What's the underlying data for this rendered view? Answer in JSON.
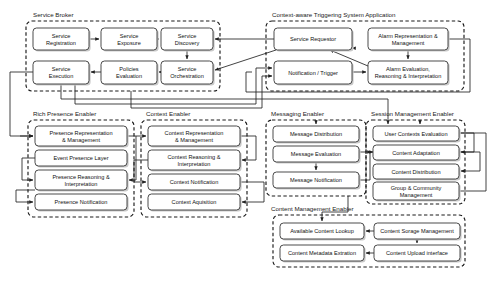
{
  "diagram": {
    "type": "block-diagram",
    "canvas": {
      "width": 503,
      "height": 283,
      "background": "#ffffff"
    },
    "style": {
      "group_border": "#1a1a1a",
      "group_border_style": "dashed",
      "box_border": "#2a2a2a",
      "box_fill": "#ffffff",
      "box_shadow": "#c9c9c9",
      "connector": "#222222"
    },
    "groups": [
      {
        "id": "service_broker",
        "label": "Service Broker",
        "label_x": 33,
        "label_y": 17,
        "x": 26,
        "y": 21,
        "w": 194,
        "h": 70,
        "boxes": [
          {
            "id": "sb_registration",
            "label": "Service\nRegistration",
            "x": 33,
            "y": 28,
            "w": 56,
            "h": 22
          },
          {
            "id": "sb_exposure",
            "label": "Service\nExposure",
            "x": 101,
            "y": 28,
            "w": 56,
            "h": 22
          },
          {
            "id": "sb_discovery",
            "label": "Service\nDiscovery",
            "x": 161,
            "y": 28,
            "w": 52,
            "h": 22
          },
          {
            "id": "sb_execution",
            "label": "Service\nExecution",
            "x": 33,
            "y": 61,
            "w": 56,
            "h": 23
          },
          {
            "id": "sb_policies",
            "label": "Policies\nEvaluation",
            "x": 101,
            "y": 61,
            "w": 56,
            "h": 23
          },
          {
            "id": "sb_orchestration",
            "label": "Service\nOrchestration",
            "x": 161,
            "y": 61,
            "w": 52,
            "h": 23
          }
        ]
      },
      {
        "id": "triggering_app",
        "label": "Context-aware Triggering System Application",
        "label_x": 272,
        "label_y": 17,
        "x": 266,
        "y": 21,
        "w": 198,
        "h": 70,
        "boxes": [
          {
            "id": "ta_requestor",
            "label": "Service Requestor",
            "x": 274,
            "y": 28,
            "w": 78,
            "h": 22
          },
          {
            "id": "ta_alarm_repr",
            "label": "Alarm Representation &\nManagement",
            "x": 368,
            "y": 28,
            "w": 80,
            "h": 22
          },
          {
            "id": "ta_notification",
            "label": "Notification / Trigger",
            "x": 274,
            "y": 61,
            "w": 78,
            "h": 23
          },
          {
            "id": "ta_alarm_eval",
            "label": "Alarm Evaluation,\nReasoning & Interpretation",
            "x": 368,
            "y": 61,
            "w": 80,
            "h": 23
          }
        ]
      },
      {
        "id": "rich_presence",
        "label": "Rich Presence Enabler",
        "label_x": 33,
        "label_y": 116,
        "x": 28,
        "y": 120,
        "w": 106,
        "h": 97,
        "boxes": [
          {
            "id": "rp_repr",
            "label": "Presence Representation\n& Management",
            "x": 35,
            "y": 126,
            "w": 92,
            "h": 20
          },
          {
            "id": "rp_event_layer",
            "label": "Event Presence Layer",
            "x": 35,
            "y": 150,
            "w": 92,
            "h": 16
          },
          {
            "id": "rp_reasoning",
            "label": "Presence Reasoning &\nInterpretation",
            "x": 35,
            "y": 170,
            "w": 92,
            "h": 20
          },
          {
            "id": "rp_notification",
            "label": "Presence Notification",
            "x": 35,
            "y": 194,
            "w": 92,
            "h": 16
          }
        ]
      },
      {
        "id": "context_enabler",
        "label": "Context Enabler",
        "label_x": 146,
        "label_y": 116,
        "x": 141,
        "y": 120,
        "w": 106,
        "h": 97,
        "boxes": [
          {
            "id": "ce_repr",
            "label": "Context Representation\n& Management",
            "x": 148,
            "y": 126,
            "w": 92,
            "h": 20
          },
          {
            "id": "ce_reasoning",
            "label": "Context Reasoning &\nInterpretation",
            "x": 148,
            "y": 150,
            "w": 92,
            "h": 20
          },
          {
            "id": "ce_notification",
            "label": "Context Notification",
            "x": 148,
            "y": 174,
            "w": 92,
            "h": 16
          },
          {
            "id": "ce_acquisition",
            "label": "Context Aquisition",
            "x": 148,
            "y": 194,
            "w": 92,
            "h": 16
          }
        ]
      },
      {
        "id": "messaging_enabler",
        "label": "Messaging Enabler",
        "label_x": 271,
        "label_y": 116,
        "x": 266,
        "y": 120,
        "w": 100,
        "h": 76,
        "boxes": [
          {
            "id": "me_distribution",
            "label": "Message Distribution",
            "x": 273,
            "y": 126,
            "w": 86,
            "h": 16
          },
          {
            "id": "me_evaluation",
            "label": "Message Evaluation",
            "x": 273,
            "y": 146,
            "w": 86,
            "h": 16
          },
          {
            "id": "me_notification",
            "label": "Message Notification",
            "x": 273,
            "y": 172,
            "w": 86,
            "h": 16
          }
        ]
      },
      {
        "id": "session_mgmt",
        "label": "Session Management Enabler",
        "label_x": 371,
        "label_y": 116,
        "x": 366,
        "y": 120,
        "w": 99,
        "h": 84,
        "boxes": [
          {
            "id": "sm_user_contexts",
            "label": "User Contexts Evaluation",
            "x": 373,
            "y": 126,
            "w": 86,
            "h": 15
          },
          {
            "id": "sm_adaptation",
            "label": "Content Adaptation",
            "x": 373,
            "y": 145,
            "w": 86,
            "h": 15
          },
          {
            "id": "sm_distribution",
            "label": "Content Distribution",
            "x": 373,
            "y": 164,
            "w": 86,
            "h": 15
          },
          {
            "id": "sm_group",
            "label": "Group & Community\nManagement",
            "x": 373,
            "y": 182,
            "w": 86,
            "h": 18
          }
        ]
      },
      {
        "id": "content_mgmt",
        "label": "Content Management Enabler",
        "label_x": 271,
        "label_y": 211,
        "x": 273,
        "y": 215,
        "w": 192,
        "h": 52,
        "boxes": [
          {
            "id": "cm_lookup",
            "label": "Available Content Lookup",
            "x": 280,
            "y": 223,
            "w": 84,
            "h": 16
          },
          {
            "id": "cm_storage",
            "label": "Content Sorage Management",
            "x": 374,
            "y": 223,
            "w": 86,
            "h": 16
          },
          {
            "id": "cm_metadata",
            "label": "Content Metadata Extration",
            "x": 280,
            "y": 245,
            "w": 84,
            "h": 16
          },
          {
            "id": "cm_upload",
            "label": "Content Upload interface",
            "x": 374,
            "y": 245,
            "w": 86,
            "h": 16
          }
        ]
      }
    ],
    "connectors": [
      {
        "id": "c-reg-exp",
        "d": "M 89,39 L 99,39",
        "arrow": "end"
      },
      {
        "id": "c-exp-disc",
        "d": "M 157,39 L 159,39",
        "arrow": "end"
      },
      {
        "id": "c-disc-orch",
        "d": "M 187,50 L 187,59",
        "arrow": "end"
      },
      {
        "id": "c-orch-pol",
        "d": "M 161,72 L 159,72",
        "arrow": "end"
      },
      {
        "id": "c-pol-exec",
        "d": "M 101,72 L 91,72",
        "arrow": "end"
      },
      {
        "id": "c-disc-in-right",
        "d": "M 272,39 L 215,39",
        "arrow": "end"
      },
      {
        "id": "c-req-out",
        "d": "M 274,39 L 272,39",
        "arrow": "none"
      },
      {
        "id": "c-req-to-orch",
        "d": "M 276,50 L 215,70",
        "arrow": "end"
      },
      {
        "id": "c-req-diag",
        "d": "M 352,48 L 310,46",
        "arrow": "start"
      },
      {
        "id": "c-alarmeval-req",
        "d": "M 368,66 L 330,50",
        "arrow": "end"
      },
      {
        "id": "c-alarmrep-eval",
        "d": "M 408,50 L 408,59",
        "arrow": "end"
      },
      {
        "id": "c-notif-eval",
        "d": "M 352,72 L 366,72",
        "arrow": "end"
      },
      {
        "id": "c-right-loop",
        "d": "M 448,39 L 470,39 L 470,92 L 246,92 L 246,72 L 252,72",
        "arrow": "start"
      },
      {
        "id": "c-exec-left",
        "d": "M 33,72 L 10,72 L 10,136 L 33,136",
        "arrow": "end"
      },
      {
        "id": "c-exec-down",
        "d": "M 61,84 L 61,99 L 388,99 L 388,124",
        "arrow": "end"
      },
      {
        "id": "c-broker-notif-a",
        "d": "M 75,84 L 75,104 L 256,104 L 256,68 L 272,68",
        "arrow": "end"
      },
      {
        "id": "c-broker-notif-b",
        "d": "M 131,91 L 131,108 L 262,108 L 262,76 L 272,76",
        "arrow": "end"
      },
      {
        "id": "c-rp-repr-in",
        "d": "M 20,136 L 33,136",
        "arrow": "end"
      },
      {
        "id": "c-rp-loop1",
        "d": "M 127,136 L 136,136 L 136,180 L 129,180",
        "arrow": "end"
      },
      {
        "id": "c-rp-evt-loop",
        "d": "M 35,158 L 22,158 L 22,180 L 33,180",
        "arrow": "end"
      },
      {
        "id": "c-rp-reason-loop",
        "d": "M 35,190 L 16,190 L 16,202 L 33,202",
        "arrow": "end"
      },
      {
        "id": "c-ce-repr-in",
        "d": "M 136,136 L 146,136",
        "arrow": "end"
      },
      {
        "id": "c-ce-loop1",
        "d": "M 240,136 L 256,136 L 256,160 L 242,160",
        "arrow": "end"
      },
      {
        "id": "c-ce-loop2",
        "d": "M 240,182 L 264,182 L 264,202 L 242,202",
        "arrow": "end"
      },
      {
        "id": "c-ce-reason-left",
        "d": "M 148,160 L 134,160 L 134,182 L 146,182",
        "arrow": "end"
      },
      {
        "id": "c-me-dist-in",
        "d": "M 316,120 L 316,124",
        "arrow": "end"
      },
      {
        "id": "c-me-eval-notif",
        "d": "M 316,162 L 316,170",
        "arrow": "end"
      },
      {
        "id": "c-me-notif-out",
        "d": "M 359,180 L 370,180 L 370,152 L 373,152",
        "arrow": "end"
      },
      {
        "id": "c-sm-user-in",
        "d": "M 420,120 L 420,124",
        "arrow": "end"
      },
      {
        "id": "c-sm-loop1",
        "d": "M 459,133 L 474,133 L 474,152 L 461,152",
        "arrow": "end"
      },
      {
        "id": "c-sm-loop2",
        "d": "M 459,152 L 480,152 L 480,171 L 461,171",
        "arrow": "end"
      },
      {
        "id": "c-sm-loop3",
        "d": "M 459,191 L 486,191 L 486,133 L 461,133",
        "arrow": "start"
      },
      {
        "id": "c-sm-left-in",
        "d": "M 360,152 L 371,152",
        "arrow": "end"
      },
      {
        "id": "c-cm-storage-lk",
        "d": "M 374,231 L 366,231",
        "arrow": "end"
      },
      {
        "id": "c-cm-storage-up",
        "d": "M 417,239 L 417,243",
        "arrow": "end"
      },
      {
        "id": "c-cm-upload-meta",
        "d": "M 374,253 L 366,253",
        "arrow": "end"
      },
      {
        "id": "c-me-to-cm",
        "d": "M 348,196 L 348,212 L 322,212 L 322,221",
        "arrow": "end"
      }
    ]
  }
}
